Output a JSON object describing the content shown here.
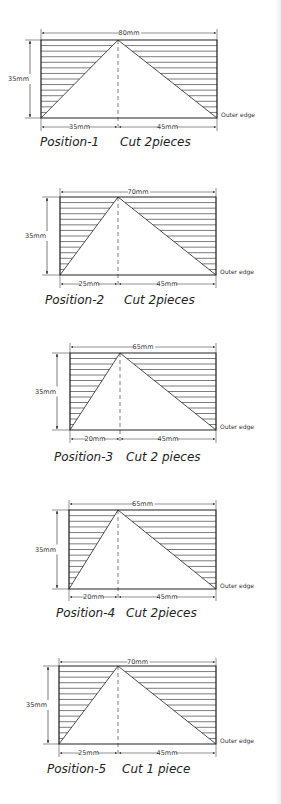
{
  "diagram": {
    "outer_edge_label": "Outer edge",
    "height_label": "35mm",
    "positions": [
      {
        "id": 1,
        "caption_position": "Position-1",
        "caption_cut": "Cut 2pieces",
        "total_label": "80mm",
        "left_label": "35mm",
        "right_label": "45mm",
        "box": {
          "x0": 41,
          "x1": 217,
          "y0": 40,
          "y1": 118,
          "apex": 118
        },
        "dim_top_y": 33,
        "dim_bottom_y": 127,
        "vdim_x": 30,
        "caption_y": 146,
        "caption_pos_x": 40,
        "caption_cut_x": 120
      },
      {
        "id": 2,
        "caption_position": "Position-2",
        "caption_cut": "Cut 2pieces",
        "total_label": "70mm",
        "left_label": "25mm",
        "right_label": "45mm",
        "box": {
          "x0": 60,
          "x1": 216,
          "y0": 197,
          "y1": 275,
          "apex": 118
        },
        "dim_top_y": 192,
        "dim_bottom_y": 284,
        "vdim_x": 47,
        "caption_y": 304,
        "caption_pos_x": 45,
        "caption_cut_x": 124
      },
      {
        "id": 3,
        "caption_position": "Position-3",
        "caption_cut": "Cut 2 pieces",
        "total_label": "65mm",
        "left_label": "20mm",
        "right_label": "45mm",
        "box": {
          "x0": 70,
          "x1": 216,
          "y0": 353,
          "y1": 430,
          "apex": 120
        },
        "dim_top_y": 347,
        "dim_bottom_y": 439,
        "vdim_x": 57,
        "caption_y": 461,
        "caption_pos_x": 54,
        "caption_cut_x": 126
      },
      {
        "id": 4,
        "caption_position": "Position-4",
        "caption_cut": "Cut 2pieces",
        "total_label": "65mm",
        "left_label": "20mm",
        "right_label": "45mm",
        "box": {
          "x0": 69,
          "x1": 216,
          "y0": 510,
          "y1": 589,
          "apex": 118
        },
        "dim_top_y": 504,
        "dim_bottom_y": 597,
        "vdim_x": 57,
        "caption_y": 617,
        "caption_pos_x": 56,
        "caption_cut_x": 126
      },
      {
        "id": 5,
        "caption_position": "Position-5",
        "caption_cut": "Cut 1 piece",
        "total_label": "70mm",
        "left_label": "25mm",
        "right_label": "45mm",
        "box": {
          "x0": 59,
          "x1": 216,
          "y0": 666,
          "y1": 744,
          "apex": 118
        },
        "dim_top_y": 662,
        "dim_bottom_y": 753,
        "vdim_x": 48,
        "caption_y": 773,
        "caption_pos_x": 47,
        "caption_cut_x": 122
      }
    ]
  },
  "colors": {
    "ink": "#222222",
    "hatch": "#444444",
    "background": "#ffffff"
  }
}
